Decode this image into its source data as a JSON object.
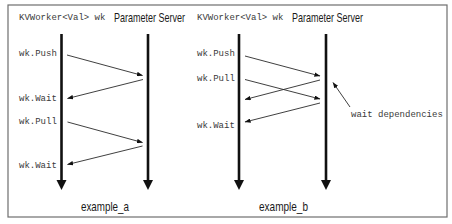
{
  "example_a": {
    "caption": "example_a",
    "worker_header": "KVWorker<Val> wk",
    "server_header": "Parameter Server",
    "worker_calls": [
      "wk.Push",
      "wk.Wait",
      "wk.Pull",
      "wk.Wait"
    ],
    "messages": [
      {
        "from": "worker",
        "to": "server",
        "call": "wk.Push"
      },
      {
        "from": "server",
        "to": "worker",
        "call": "wk.Wait"
      },
      {
        "from": "worker",
        "to": "server",
        "call": "wk.Pull"
      },
      {
        "from": "server",
        "to": "worker",
        "call": "wk.Wait"
      }
    ]
  },
  "example_b": {
    "caption": "example_b",
    "worker_header": "KVWorker<Val> wk",
    "server_header": "Parameter Server",
    "worker_calls": [
      "wk.Push",
      "wk.Pull",
      "wk.Wait"
    ],
    "messages": [
      {
        "from": "worker",
        "to": "server",
        "call": "wk.Push"
      },
      {
        "from": "worker",
        "to": "server",
        "call": "wk.Pull"
      },
      {
        "from": "server",
        "to": "worker",
        "call": "reply"
      },
      {
        "from": "server",
        "to": "worker",
        "call": "wk.Wait"
      }
    ],
    "annotation": "wait dependencies"
  },
  "colors": {
    "background": "#ffffff",
    "frame": "#6e6e6e",
    "lines": "#111111",
    "mono_text": "#3a3a3a"
  }
}
